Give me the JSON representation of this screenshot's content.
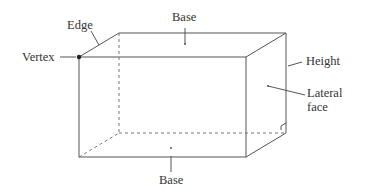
{
  "diagram": {
    "labels": {
      "edge": "Edge",
      "vertex": "Vertex",
      "base_top": "Base",
      "base_bottom": "Base",
      "height": "Height",
      "lateral_face_line1": "Lateral",
      "lateral_face_line2": "face"
    },
    "colors": {
      "line": "#555555",
      "text": "#333333",
      "background": "#ffffff"
    }
  }
}
